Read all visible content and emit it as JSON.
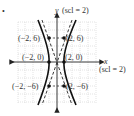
{
  "figure": {
    "bullet": "•",
    "y_axis_label": "y",
    "y_scale_label": "(scl = 2)",
    "x_axis_label": "x",
    "x_scale_label": "(scl = 2)",
    "points": [
      {
        "label": "(−2, 6)",
        "x": -2,
        "y": 6
      },
      {
        "label": "(2, 6)",
        "x": 2,
        "y": 6
      },
      {
        "label": "(−2, 0)",
        "x": -2,
        "y": 0
      },
      {
        "label": "(2, 0)",
        "x": 2,
        "y": 0
      },
      {
        "label": "(−2, −6)",
        "x": -2,
        "y": -6
      },
      {
        "label": "(2, −6)",
        "x": 2,
        "y": -6
      }
    ],
    "curve": "hyperbola with vertices (±2, 0), asymptotes y = ±3x (dashed)",
    "colors": {
      "curve": "#111111",
      "grid": "#cccccc",
      "axis": "#222222"
    }
  }
}
